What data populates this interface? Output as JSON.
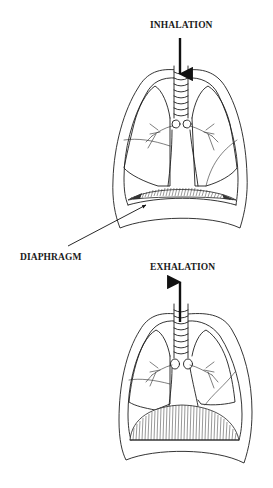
{
  "figure": {
    "panels": [
      {
        "id": "inhalation",
        "label": "INHALATION",
        "arrow_direction": "down",
        "diaphragm_state": "flattened / contracted"
      },
      {
        "id": "exhalation",
        "label": "EXHALATION",
        "arrow_direction": "up",
        "diaphragm_state": "domed / relaxed"
      }
    ],
    "callouts": [
      {
        "label": "DIAPHRAGM",
        "points_to": "inhalation diaphragm"
      }
    ],
    "colors": {
      "line": "#1e1e1e",
      "background": "#ffffff"
    }
  }
}
